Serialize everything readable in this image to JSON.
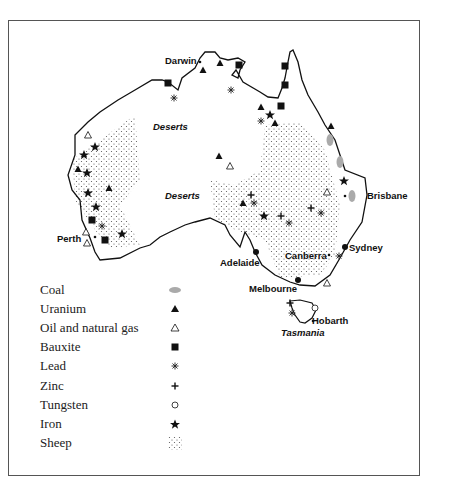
{
  "map": {
    "title": "Australia resources map",
    "cities": {
      "darwin": "Darwin",
      "brisbane": "Brisbane",
      "sydney": "Sydney",
      "canberra": "Canberra",
      "melbourne": "Melbourne",
      "adelaide": "Adelaide",
      "perth": "Perth",
      "hobarth": "Hobarth"
    },
    "regions": {
      "deserts_north": "Deserts",
      "deserts_center": "Deserts",
      "tasmania": "Tasmania"
    },
    "colors": {
      "outline": "#111111",
      "coal": "#aaaaaa",
      "frame": "#555555"
    }
  },
  "legend": {
    "items": [
      {
        "label": "Coal",
        "symbol": "coal-ellipse-icon"
      },
      {
        "label": "Uranium",
        "symbol": "filled-triangle-icon"
      },
      {
        "label": "Oil and natural gas",
        "symbol": "open-triangle-icon"
      },
      {
        "label": "Bauxite",
        "symbol": "filled-square-icon"
      },
      {
        "label": "Lead",
        "symbol": "asterisk-icon"
      },
      {
        "label": "Zinc",
        "symbol": "plus-icon"
      },
      {
        "label": "Tungsten",
        "symbol": "open-circle-icon"
      },
      {
        "label": "Iron",
        "symbol": "star-icon"
      },
      {
        "label": "Sheep",
        "symbol": "dotted-pattern-icon"
      }
    ]
  }
}
